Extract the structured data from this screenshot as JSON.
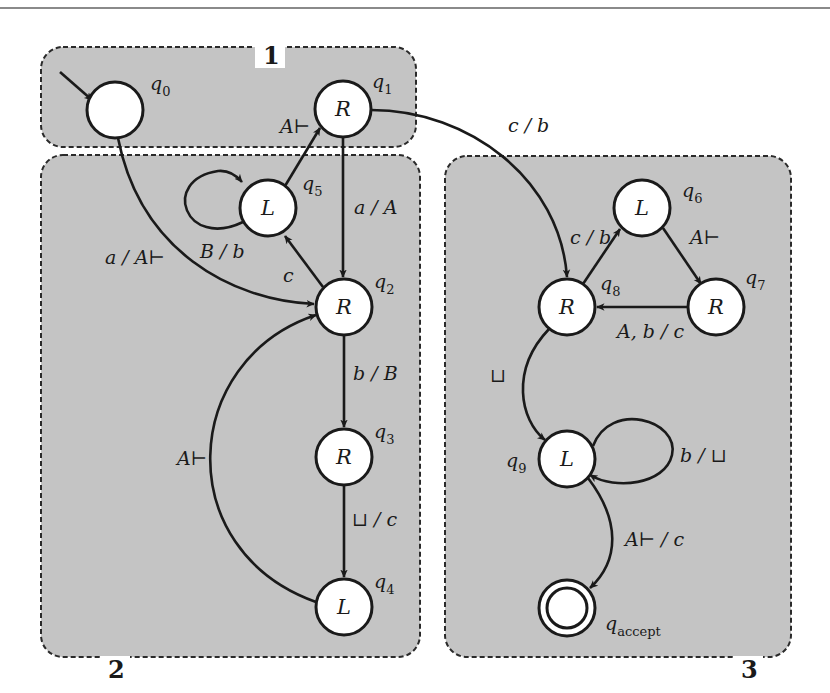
{
  "figure": {
    "type": "state-diagram"
  },
  "regions": [
    {
      "id": "1",
      "label": "1",
      "x": 41,
      "y": 47,
      "w": 375,
      "h": 100,
      "label_x": 263,
      "label_y": 56
    },
    {
      "id": "2",
      "label": "2",
      "x": 41,
      "y": 155,
      "w": 379,
      "h": 502,
      "label_x": 108,
      "label_y": 670
    },
    {
      "id": "3",
      "label": "3",
      "x": 445,
      "y": 156,
      "w": 346,
      "h": 501,
      "label_x": 741,
      "label_y": 670
    }
  ],
  "states": [
    {
      "id": "q0",
      "name": "q",
      "sub": "0",
      "symbol": "",
      "cx": 115,
      "cy": 110,
      "name_x": 150,
      "name_y": 90,
      "start": true,
      "accept": false
    },
    {
      "id": "q1",
      "name": "q",
      "sub": "1",
      "symbol": "R",
      "cx": 343,
      "cy": 109,
      "name_x": 372,
      "name_y": 88,
      "start": false,
      "accept": false
    },
    {
      "id": "q5",
      "name": "q",
      "sub": "5",
      "symbol": "L",
      "cx": 268,
      "cy": 208,
      "name_x": 302,
      "name_y": 190,
      "start": false,
      "accept": false
    },
    {
      "id": "q2",
      "name": "q",
      "sub": "2",
      "symbol": "R",
      "cx": 344,
      "cy": 307,
      "name_x": 374,
      "name_y": 288,
      "start": false,
      "accept": false
    },
    {
      "id": "q3",
      "name": "q",
      "sub": "3",
      "symbol": "R",
      "cx": 344,
      "cy": 457,
      "name_x": 374,
      "name_y": 438,
      "start": false,
      "accept": false
    },
    {
      "id": "q4",
      "name": "q",
      "sub": "4",
      "symbol": "L",
      "cx": 344,
      "cy": 607,
      "name_x": 374,
      "name_y": 588,
      "start": false,
      "accept": false
    },
    {
      "id": "q6",
      "name": "q",
      "sub": "6",
      "symbol": "L",
      "cx": 642,
      "cy": 208,
      "name_x": 682,
      "name_y": 197,
      "start": false,
      "accept": false
    },
    {
      "id": "q7",
      "name": "q",
      "sub": "7",
      "symbol": "R",
      "cx": 716,
      "cy": 307,
      "name_x": 745,
      "name_y": 284,
      "start": false,
      "accept": false
    },
    {
      "id": "q8",
      "name": "q",
      "sub": "8",
      "symbol": "R",
      "cx": 567,
      "cy": 307,
      "name_x": 600,
      "name_y": 290,
      "start": false,
      "accept": false
    },
    {
      "id": "q9",
      "name": "q",
      "sub": "9",
      "symbol": "L",
      "cx": 567,
      "cy": 459,
      "name_x": 506,
      "name_y": 467,
      "start": false,
      "accept": false
    },
    {
      "id": "qaccept",
      "name": "q",
      "sub": "accept",
      "symbol": "",
      "cx": 567,
      "cy": 608,
      "name_x": 605,
      "name_y": 630,
      "start": false,
      "accept": true
    }
  ],
  "transitions": [
    {
      "from": "start",
      "to": "q0",
      "label": "",
      "path": "M 60 72 L 92 100",
      "label_x": 0,
      "label_y": 0
    },
    {
      "from": "q0",
      "to": "q2",
      "label": "a / A⊢",
      "path": "M 118 138 C 140 250, 230 300, 314 304",
      "label_x": 105,
      "label_y": 264
    },
    {
      "from": "q5",
      "to": "q1",
      "label": "A⊢",
      "path": "M 285 186 L 320 128",
      "label_x": 280,
      "label_y": 133
    },
    {
      "from": "q5",
      "to": "q5",
      "label": "B / b",
      "path": "M 243 222 C 185 250, 160 180, 218 171 C 228 170, 236 175, 242 182",
      "label_x": 200,
      "label_y": 258
    },
    {
      "from": "q1",
      "to": "q2",
      "label": "a / A",
      "path": "M 343 137 L 343 277",
      "label_x": 354,
      "label_y": 214
    },
    {
      "from": "q2",
      "to": "q5",
      "label": "c",
      "path": "M 323 287 L 285 236",
      "label_x": 283,
      "label_y": 282
    },
    {
      "from": "q1",
      "to": "q8",
      "label": "c / b",
      "path": "M 371 110 C 470 110, 560 180, 567 277",
      "label_x": 508,
      "label_y": 132
    },
    {
      "from": "q2",
      "to": "q3",
      "label": "b / B",
      "path": "M 344 335 L 344 427",
      "label_x": 353,
      "label_y": 380
    },
    {
      "from": "q3",
      "to": "q4",
      "label": "⊔ / c",
      "path": "M 344 485 L 344 577",
      "label_x": 352,
      "label_y": 526
    },
    {
      "from": "q4",
      "to": "q2",
      "label": "A⊢",
      "path": "M 316 602 C 170 550, 180 360, 316 315",
      "label_x": 177,
      "label_y": 465
    },
    {
      "from": "q8",
      "to": "q6",
      "label": "c / b",
      "path": "M 583 284 L 620 229",
      "label_x": 570,
      "label_y": 244
    },
    {
      "from": "q6",
      "to": "q7",
      "label": "A⊢",
      "path": "M 663 228 L 701 284",
      "label_x": 690,
      "label_y": 244
    },
    {
      "from": "q7",
      "to": "q8",
      "label": "A, b / c",
      "path": "M 688 307 L 597 307",
      "label_x": 617,
      "label_y": 338
    },
    {
      "from": "q8",
      "to": "q9",
      "label": "⊔",
      "path": "M 549 329 C 510 370, 520 420, 545 440",
      "label_x": 490,
      "label_y": 382
    },
    {
      "from": "q9",
      "to": "q9",
      "label": "b / ⊔",
      "path": "M 593 446 C 610 400, 680 420, 672 455 C 665 485, 615 490, 590 475",
      "label_x": 680,
      "label_y": 462
    },
    {
      "from": "q9",
      "to": "qaccept",
      "label": "A⊢ / c",
      "path": "M 588 478 C 620 520, 620 560, 590 588",
      "label_x": 625,
      "label_y": 546
    }
  ],
  "colors": {
    "region_fill": "#c4c4c4",
    "stroke": "#1a1a1a",
    "state_fill": "#ffffff",
    "background": "#ffffff"
  }
}
